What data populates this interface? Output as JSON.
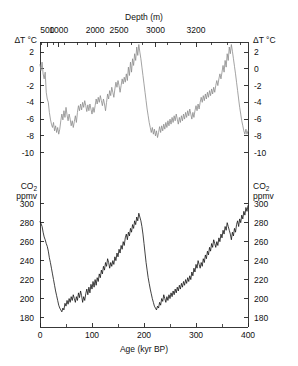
{
  "figure": {
    "title_top_axis": "Depth (m)",
    "title_bottom_axis": "Age (kyr BP)",
    "top_panel_ylabel_line1": "ΔT °C",
    "bottom_panel_ylabel_line1": "CO",
    "bottom_panel_ylabel_sub": "2",
    "bottom_panel_ylabel_line2": "ppmv",
    "colors": {
      "temperature_curve": "#8c8c8c",
      "co2_curve": "#111111",
      "axis": "#222222",
      "background": "#ffffff"
    }
  },
  "chart_data": [
    {
      "type": "line",
      "name": "temperature-anomaly",
      "title": "",
      "xlabel": "Age (kyr BP)",
      "ylabel": "ΔT °C",
      "xlim": [
        0,
        400
      ],
      "ylim": [
        -11,
        3.2
      ],
      "yticks": [
        2,
        0,
        -2,
        -4,
        -6,
        -8,
        -10
      ],
      "ytick_labels": [
        "2",
        "0",
        "-2",
        "-4",
        "-6",
        "-8",
        "-10"
      ],
      "grid": false,
      "color": "#8c8c8c",
      "secondary_xaxis": {
        "label": "Depth (m)",
        "ticks": [
          500,
          1000,
          2000,
          2500,
          3000,
          3200
        ],
        "tick_labels": [
          "500",
          "1000",
          "2000",
          "2500",
          "3000",
          "3200"
        ],
        "tick_positions_age_kyr": [
          14,
          36,
          106,
          152,
          222,
          300
        ],
        "minor_ticks_age_kyr": [
          3,
          25,
          48,
          72,
          92,
          128,
          175,
          198,
          245,
          270,
          330,
          360,
          385
        ]
      },
      "x": [
        0,
        2,
        4,
        6,
        8,
        10,
        12,
        14,
        16,
        18,
        20,
        22,
        24,
        26,
        28,
        30,
        32,
        34,
        36,
        38,
        40,
        42,
        44,
        46,
        48,
        50,
        52,
        54,
        56,
        58,
        60,
        62,
        64,
        66,
        68,
        70,
        72,
        74,
        76,
        78,
        80,
        82,
        84,
        86,
        88,
        90,
        92,
        94,
        96,
        98,
        100,
        102,
        104,
        106,
        108,
        110,
        112,
        114,
        116,
        118,
        120,
        122,
        124,
        126,
        128,
        130,
        132,
        134,
        136,
        138,
        140,
        142,
        144,
        146,
        148,
        150,
        152,
        154,
        156,
        158,
        160,
        162,
        164,
        166,
        168,
        170,
        172,
        174,
        176,
        178,
        180,
        182,
        184,
        186,
        188,
        190,
        192,
        194,
        196,
        198,
        200,
        202,
        204,
        206,
        208,
        210,
        212,
        214,
        216,
        218,
        220,
        222,
        224,
        226,
        228,
        230,
        232,
        234,
        236,
        238,
        240,
        242,
        244,
        246,
        248,
        250,
        252,
        254,
        256,
        258,
        260,
        262,
        264,
        266,
        268,
        270,
        272,
        274,
        276,
        278,
        280,
        282,
        284,
        286,
        288,
        290,
        292,
        294,
        296,
        298,
        300,
        302,
        304,
        306,
        308,
        310,
        312,
        314,
        316,
        318,
        320,
        322,
        324,
        326,
        328,
        330,
        332,
        334,
        336,
        338,
        340,
        342,
        344,
        346,
        348,
        350,
        352,
        354,
        356,
        358,
        360,
        362,
        364,
        366,
        368,
        370,
        372,
        374,
        376,
        378,
        380,
        382,
        384,
        386,
        388,
        390,
        392,
        394,
        396,
        398,
        400
      ],
      "y": [
        0.5,
        -0.2,
        0.8,
        -0.6,
        -1.2,
        -0.4,
        -2.8,
        -3.6,
        -4.0,
        -5.2,
        -6.0,
        -6.6,
        -7.0,
        -6.4,
        -7.4,
        -6.8,
        -7.6,
        -7.0,
        -7.8,
        -7.2,
        -6.2,
        -5.4,
        -6.1,
        -5.0,
        -5.8,
        -4.6,
        -5.5,
        -6.2,
        -5.4,
        -6.0,
        -6.8,
        -6.2,
        -7.0,
        -6.3,
        -5.6,
        -6.4,
        -5.2,
        -4.4,
        -5.0,
        -4.2,
        -4.9,
        -4.0,
        -4.6,
        -3.8,
        -4.4,
        -5.1,
        -4.3,
        -5.0,
        -4.2,
        -4.8,
        -5.4,
        -4.6,
        -5.2,
        -4.4,
        -3.6,
        -4.2,
        -3.4,
        -4.0,
        -3.2,
        -3.8,
        -4.4,
        -3.6,
        -4.2,
        -5.0,
        -4.0,
        -3.0,
        -3.6,
        -2.6,
        -3.2,
        -2.2,
        -2.8,
        -3.4,
        -2.4,
        -1.6,
        -2.2,
        -1.4,
        -2.0,
        -2.8,
        -2.0,
        -1.2,
        -1.8,
        -1.0,
        -1.6,
        -0.6,
        -1.4,
        0.2,
        -0.8,
        0.8,
        -0.4,
        1.2,
        0.4,
        1.8,
        1.0,
        2.6,
        1.6,
        2.9,
        2.0,
        1.2,
        0.2,
        -0.8,
        -1.8,
        -2.8,
        -3.8,
        -4.8,
        -5.6,
        -6.4,
        -7.0,
        -7.6,
        -7.0,
        -7.8,
        -7.2,
        -8.0,
        -7.4,
        -8.2,
        -7.6,
        -6.9,
        -7.6,
        -6.8,
        -7.4,
        -6.6,
        -7.2,
        -6.4,
        -7.0,
        -6.2,
        -6.8,
        -6.0,
        -6.6,
        -5.8,
        -6.4,
        -5.6,
        -6.2,
        -5.4,
        -6.0,
        -6.6,
        -5.8,
        -6.4,
        -5.6,
        -6.2,
        -5.4,
        -6.0,
        -5.2,
        -5.8,
        -5.0,
        -5.6,
        -4.8,
        -5.4,
        -6.0,
        -5.2,
        -5.8,
        -5.0,
        -4.4,
        -5.0,
        -4.2,
        -4.8,
        -4.0,
        -3.4,
        -4.0,
        -3.2,
        -3.8,
        -3.0,
        -3.6,
        -2.8,
        -3.4,
        -2.6,
        -3.2,
        -2.4,
        -3.0,
        -2.2,
        -2.8,
        -2.0,
        -1.4,
        -2.0,
        -1.2,
        -0.6,
        -1.2,
        -0.4,
        0.4,
        -0.4,
        1.0,
        0.2,
        1.8,
        1.0,
        2.6,
        1.8,
        2.9,
        2.1,
        1.2,
        0.3,
        -0.6,
        -1.6,
        -2.6,
        -3.6,
        -4.6,
        -5.4,
        -6.2,
        -6.8,
        -7.4,
        -7.8,
        -7.2,
        -7.8,
        -7.4,
        -8.0,
        -7.6,
        -8.1,
        -7.5,
        -8.0,
        -7.4,
        -7.9,
        -7.3,
        -7.8,
        -7.2,
        -7.6,
        -7.0,
        -7.4,
        -6.8,
        -7.2,
        -6.6,
        -7.0,
        -6.4,
        -6.8,
        -6.2,
        -6.6,
        -6.0,
        -5.4,
        -6.0,
        -5.2,
        -5.8,
        -5.0,
        -5.6,
        -4.8,
        -5.4,
        -4.6,
        -5.2,
        -4.4,
        -5.0,
        -4.2,
        -4.8,
        -4.0,
        -4.6,
        -3.8,
        -4.4,
        -3.6,
        -4.2,
        -3.4,
        -4.0,
        -3.2,
        -3.8,
        -3.0,
        -3.6,
        -4.2,
        -3.4,
        -4.0,
        -4.6,
        -3.8,
        -4.4,
        -5.0,
        -4.2,
        -4.8,
        -5.4,
        -4.6,
        -5.2,
        -4.4,
        -5.0,
        -4.2,
        -4.8,
        -4.0,
        -4.6,
        -3.8,
        -4.4,
        -5.0,
        -4.2,
        -4.8,
        -5.4,
        -4.6,
        -5.2,
        -4.4,
        -3.6,
        -4.2,
        -3.4,
        -2.6,
        -3.2,
        -2.4,
        -1.8,
        -2.4,
        -1.6
      ]
    },
    {
      "type": "line",
      "name": "co2-concentration",
      "title": "",
      "xlabel": "Age (kyr BP)",
      "ylabel": "CO2 ppmv",
      "xlim": [
        0,
        400
      ],
      "ylim": [
        170,
        305
      ],
      "yticks": [
        300,
        280,
        260,
        240,
        220,
        200,
        180
      ],
      "ytick_labels": [
        "300",
        "280",
        "260",
        "240",
        "220",
        "200",
        "180"
      ],
      "xticks": [
        0,
        100,
        200,
        300,
        400
      ],
      "xtick_labels": [
        "0",
        "100",
        "200",
        "300",
        "400"
      ],
      "minor_xticks": [
        50,
        150,
        250,
        350
      ],
      "grid": false,
      "color": "#111111",
      "x": [
        0,
        2,
        4,
        6,
        8,
        10,
        12,
        14,
        16,
        18,
        20,
        22,
        24,
        26,
        28,
        30,
        32,
        34,
        36,
        38,
        40,
        42,
        44,
        46,
        48,
        50,
        52,
        54,
        56,
        58,
        60,
        62,
        64,
        66,
        68,
        70,
        72,
        74,
        76,
        78,
        80,
        82,
        84,
        86,
        88,
        90,
        92,
        94,
        96,
        98,
        100,
        102,
        104,
        106,
        108,
        110,
        112,
        114,
        116,
        118,
        120,
        122,
        124,
        126,
        128,
        130,
        132,
        134,
        136,
        138,
        140,
        142,
        144,
        146,
        148,
        150,
        152,
        154,
        156,
        158,
        160,
        162,
        164,
        166,
        168,
        170,
        172,
        174,
        176,
        178,
        180,
        182,
        184,
        186,
        188,
        190,
        192,
        194,
        196,
        198,
        200,
        202,
        204,
        206,
        208,
        210,
        212,
        214,
        216,
        218,
        220,
        222,
        224,
        226,
        228,
        230,
        232,
        234,
        236,
        238,
        240,
        242,
        244,
        246,
        248,
        250,
        252,
        254,
        256,
        258,
        260,
        262,
        264,
        266,
        268,
        270,
        272,
        274,
        276,
        278,
        280,
        282,
        284,
        286,
        288,
        290,
        292,
        294,
        296,
        298,
        300,
        302,
        304,
        306,
        308,
        310,
        312,
        314,
        316,
        318,
        320,
        322,
        324,
        326,
        328,
        330,
        332,
        334,
        336,
        338,
        340,
        342,
        344,
        346,
        348,
        350,
        352,
        354,
        356,
        358,
        360,
        362,
        364,
        366,
        368,
        370,
        372,
        374,
        376,
        378,
        380,
        382,
        384,
        386,
        388,
        390,
        392,
        394,
        396,
        398,
        400
      ],
      "y": [
        281,
        279,
        276,
        270,
        265,
        262,
        258,
        255,
        250,
        243,
        238,
        232,
        226,
        220,
        214,
        208,
        203,
        198,
        193,
        190,
        188,
        186,
        190,
        188,
        195,
        192,
        198,
        194,
        200,
        196,
        202,
        198,
        204,
        200,
        196,
        202,
        198,
        206,
        201,
        208,
        203,
        196,
        202,
        198,
        205,
        210,
        204,
        212,
        206,
        215,
        210,
        218,
        212,
        220,
        214,
        222,
        218,
        226,
        222,
        230,
        226,
        234,
        230,
        238,
        234,
        242,
        238,
        232,
        238,
        234,
        240,
        236,
        244,
        240,
        248,
        244,
        252,
        248,
        256,
        252,
        260,
        256,
        264,
        268,
        262,
        270,
        266,
        274,
        270,
        278,
        274,
        282,
        278,
        286,
        282,
        290,
        286,
        282,
        276,
        268,
        258,
        248,
        238,
        230,
        222,
        216,
        210,
        205,
        200,
        196,
        192,
        190,
        188,
        192,
        190,
        196,
        193,
        200,
        197,
        204,
        200,
        196,
        202,
        198,
        204,
        200,
        206,
        202,
        208,
        204,
        210,
        206,
        212,
        208,
        214,
        210,
        216,
        212,
        218,
        214,
        220,
        216,
        222,
        218,
        224,
        220,
        228,
        224,
        232,
        228,
        236,
        232,
        240,
        236,
        232,
        238,
        234,
        242,
        238,
        246,
        242,
        250,
        246,
        254,
        250,
        258,
        254,
        262,
        258,
        254,
        260,
        256,
        264,
        260,
        268,
        264,
        272,
        268,
        276,
        272,
        280,
        276,
        272,
        268,
        262,
        270,
        266,
        274,
        270,
        278,
        282,
        276,
        284,
        280,
        288,
        284,
        292,
        288,
        296,
        292,
        298,
        294,
        290,
        284,
        278,
        272,
        266,
        260,
        254,
        248,
        242,
        236,
        230,
        224,
        218,
        212,
        206,
        202,
        198,
        194,
        190,
        188,
        186,
        184,
        190,
        187,
        194,
        191,
        198,
        195,
        202,
        198,
        205,
        202,
        209,
        206,
        213,
        210,
        217,
        214,
        221,
        218,
        225,
        222,
        229,
        226,
        233,
        230,
        237,
        234,
        241,
        238,
        245,
        242,
        249,
        246,
        243,
        250,
        247,
        254,
        251,
        258,
        255,
        262,
        259,
        266,
        263,
        270,
        267,
        274,
        271,
        278,
        275,
        280,
        276,
        282,
        278,
        284,
        280
      ]
    }
  ]
}
